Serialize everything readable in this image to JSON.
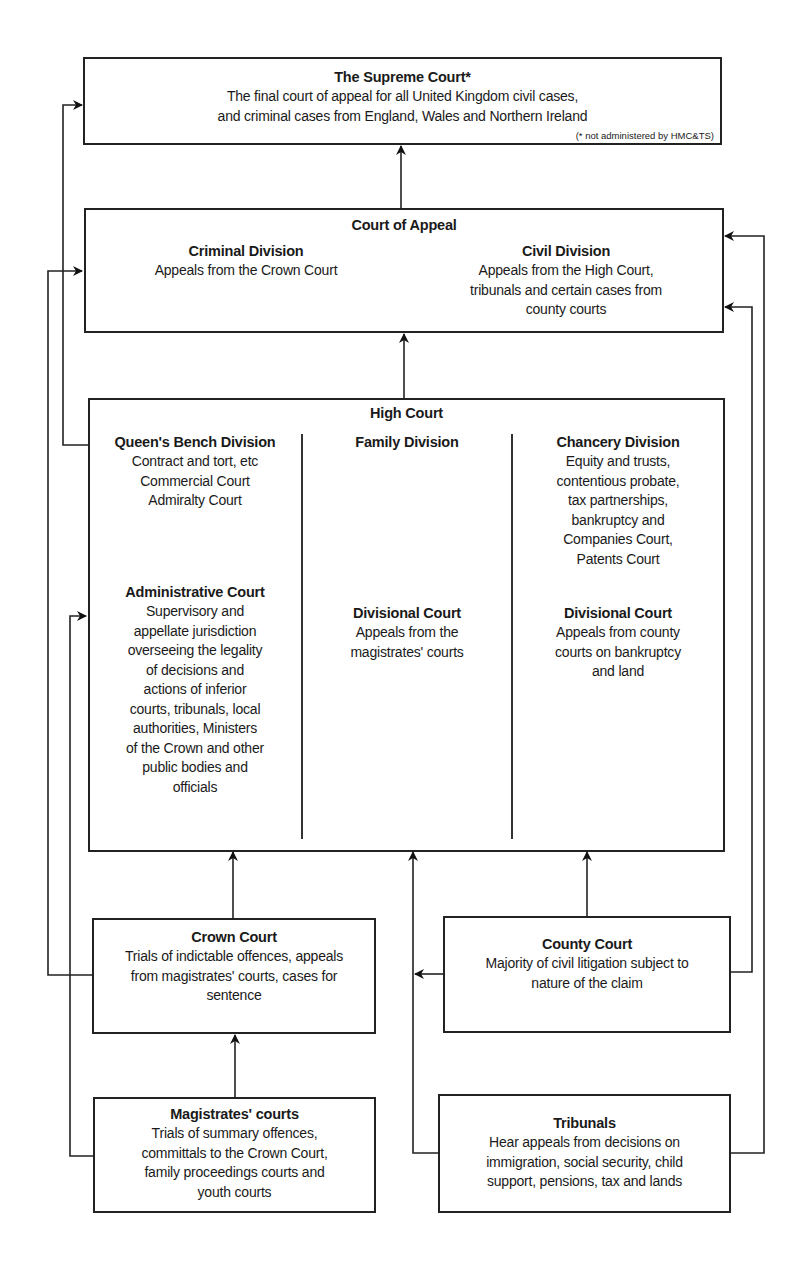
{
  "diagram": {
    "type": "hierarchy"
  },
  "supreme_court": {
    "title": "The Supreme Court*",
    "lines": [
      "The final court of appeal for all United Kingdom civil cases,",
      "and criminal cases from England, Wales and Northern Ireland"
    ],
    "footnote": "(* not administered by HMC&TS)"
  },
  "court_of_appeal": {
    "title": "Court of Appeal",
    "criminal": {
      "title": "Criminal Division",
      "lines": [
        "Appeals from the Crown Court"
      ]
    },
    "civil": {
      "title": "Civil Division",
      "lines": [
        "Appeals from the High Court,",
        "tribunals and certain cases from",
        "county courts"
      ]
    }
  },
  "high_court": {
    "title": "High Court",
    "queens_bench": {
      "title": "Queen's Bench Division",
      "lines": [
        "Contract and tort, etc",
        "Commercial Court",
        "Admiralty Court"
      ]
    },
    "family": {
      "title": "Family Division"
    },
    "chancery": {
      "title": "Chancery Division",
      "lines": [
        "Equity and trusts,",
        "contentious probate,",
        "tax partnerships,",
        "bankruptcy and",
        "Companies Court,",
        "Patents Court"
      ]
    },
    "administrative": {
      "title": "Administrative Court",
      "lines": [
        "Supervisory and",
        "appellate jurisdiction",
        "overseeing the legality",
        "of decisions and",
        "actions of inferior",
        "courts, tribunals, local",
        "authorities, Ministers",
        "of the Crown and other",
        "public bodies and",
        "officials"
      ]
    },
    "family_divisional": {
      "title": "Divisional Court",
      "lines": [
        "Appeals from the",
        "magistrates' courts"
      ]
    },
    "chancery_divisional": {
      "title": "Divisional Court",
      "lines": [
        "Appeals from county",
        "courts on bankruptcy",
        "and land"
      ]
    }
  },
  "crown_court": {
    "title": "Crown Court",
    "lines": [
      "Trials of indictable offences, appeals",
      "from magistrates' courts, cases for",
      "sentence"
    ]
  },
  "county_court": {
    "title": "County Court",
    "lines": [
      "Majority of civil litigation subject to",
      "nature of the claim"
    ]
  },
  "magistrates_courts": {
    "title": "Magistrates' courts",
    "lines": [
      "Trials of summary offences,",
      "committals to the Crown Court,",
      "family proceedings courts and",
      "youth courts"
    ]
  },
  "tribunals": {
    "title": "Tribunals",
    "lines": [
      "Hear appeals from decisions on",
      "immigration, social security, child",
      "support, pensions, tax and lands"
    ]
  },
  "connections": [
    {
      "from": "Court of Appeal",
      "to": "The Supreme Court"
    },
    {
      "from": "High Court",
      "to": "Court of Appeal"
    },
    {
      "from": "High Court (Queen's Bench Division)",
      "to": "The Supreme Court"
    },
    {
      "from": "Crown Court",
      "to": "Court of Appeal (Criminal Division)"
    },
    {
      "from": "Crown Court",
      "to": "High Court"
    },
    {
      "from": "Magistrates' courts",
      "to": "Crown Court"
    },
    {
      "from": "Magistrates' courts",
      "to": "High Court (Administrative Court)"
    },
    {
      "from": "County Court",
      "to": "High Court"
    },
    {
      "from": "County Court",
      "to": "Court of Appeal (Civil Division)"
    },
    {
      "from": "Tribunals",
      "to": "High Court"
    },
    {
      "from": "Tribunals",
      "to": "Court of Appeal (Civil Division)"
    }
  ],
  "colors": {
    "line": "#222222",
    "text": "#1a1a1a",
    "background": "#ffffff"
  }
}
